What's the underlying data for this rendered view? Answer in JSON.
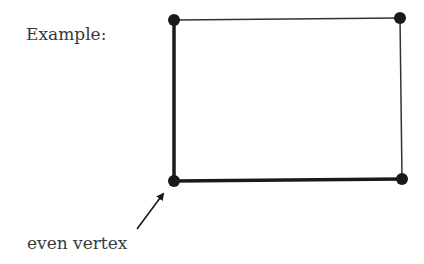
{
  "labels": {
    "example": "Example:",
    "annotation": "even vertex"
  },
  "graph": {
    "vertices": [
      {
        "id": "top-left",
        "x": 174,
        "y": 20
      },
      {
        "id": "top-right",
        "x": 400,
        "y": 18
      },
      {
        "id": "bottom-right",
        "x": 402,
        "y": 179
      },
      {
        "id": "bottom-left",
        "x": 174,
        "y": 181
      }
    ],
    "edges": [
      {
        "from": "top-left",
        "to": "top-right",
        "weight": "thin"
      },
      {
        "from": "top-right",
        "to": "bottom-right",
        "weight": "thin"
      },
      {
        "from": "bottom-right",
        "to": "bottom-left",
        "weight": "thick"
      },
      {
        "from": "bottom-left",
        "to": "top-left",
        "weight": "thick"
      }
    ],
    "highlighted_vertex": "bottom-left"
  },
  "colors": {
    "stroke": "#1a1a1a",
    "text": "#3a3a3a",
    "background": "#ffffff"
  }
}
